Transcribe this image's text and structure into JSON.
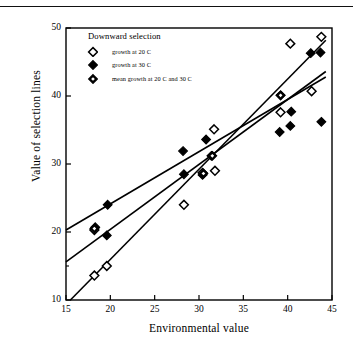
{
  "figure": {
    "top_rule": true,
    "background": "#ffffff",
    "ink": "#000000"
  },
  "chart_data": {
    "type": "scatter",
    "title": "",
    "xlabel": "Environmental value",
    "ylabel": "Value of selection lines",
    "xlim": [
      15,
      45
    ],
    "ylim": [
      10,
      50
    ],
    "xticks": [
      15,
      20,
      25,
      30,
      35,
      40,
      45
    ],
    "yticks": [
      10,
      20,
      30,
      40,
      50
    ],
    "grid": false,
    "frame": "box",
    "legend_position": "top-left inside axes",
    "legend_title": "Downward selection",
    "series": [
      {
        "name": "growth at 20 C",
        "marker": "open-diamond",
        "points": [
          {
            "x": 18.2,
            "y": 13.6
          },
          {
            "x": 19.6,
            "y": 15.0
          },
          {
            "x": 18.2,
            "y": 20.3
          },
          {
            "x": 28.3,
            "y": 24.0
          },
          {
            "x": 30.4,
            "y": 28.7
          },
          {
            "x": 31.8,
            "y": 29.0
          },
          {
            "x": 31.7,
            "y": 35.1
          },
          {
            "x": 39.2,
            "y": 37.6
          },
          {
            "x": 42.7,
            "y": 40.7
          },
          {
            "x": 40.3,
            "y": 47.7
          },
          {
            "x": 43.8,
            "y": 48.7
          }
        ],
        "fit_line": {
          "x1": 15.5,
          "y1": 10.0,
          "x2": 44.3,
          "y2": 48.2
        }
      },
      {
        "name": "growth at 30 C",
        "marker": "filled-diamond",
        "points": [
          {
            "x": 19.6,
            "y": 19.5
          },
          {
            "x": 18.3,
            "y": 20.7
          },
          {
            "x": 19.7,
            "y": 24.0
          },
          {
            "x": 28.3,
            "y": 28.5
          },
          {
            "x": 28.2,
            "y": 31.9
          },
          {
            "x": 30.4,
            "y": 28.4
          },
          {
            "x": 30.8,
            "y": 33.6
          },
          {
            "x": 31.4,
            "y": 31.2
          },
          {
            "x": 39.1,
            "y": 34.7
          },
          {
            "x": 40.3,
            "y": 35.6
          },
          {
            "x": 40.4,
            "y": 37.7
          },
          {
            "x": 39.2,
            "y": 40.1
          },
          {
            "x": 42.6,
            "y": 46.3
          },
          {
            "x": 43.7,
            "y": 46.4
          },
          {
            "x": 43.8,
            "y": 36.2
          }
        ],
        "fit_line": {
          "x1": 15.0,
          "y1": 20.3,
          "x2": 44.3,
          "y2": 42.8
        }
      },
      {
        "name": "mean growth at 20 C and 30 C",
        "marker": "half-filled-diamond",
        "points": [
          {
            "x": 18.2,
            "y": 20.5
          },
          {
            "x": 30.5,
            "y": 28.6
          },
          {
            "x": 31.5,
            "y": 31.2
          },
          {
            "x": 39.2,
            "y": 40.1
          }
        ],
        "fit_line": {
          "x1": 15.0,
          "y1": 15.6,
          "x2": 44.3,
          "y2": 43.6
        }
      }
    ]
  },
  "axis_labels": {
    "x_title": "Environmental value",
    "y_title": "Value of selection lines"
  },
  "legend": {
    "title": "Downward selection",
    "entries": [
      {
        "label": "growth at 20 C",
        "marker": "open-diamond"
      },
      {
        "label": "growth at 30 C",
        "marker": "filled-diamond"
      },
      {
        "label": "mean growth at 20 C and 30 C",
        "marker": "half-filled-diamond"
      }
    ]
  }
}
